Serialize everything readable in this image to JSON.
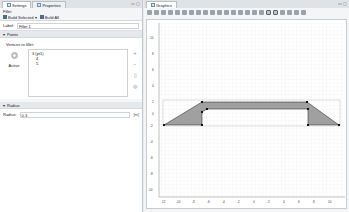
{
  "left_panel": {
    "tabs": [
      {
        "label": "Settings",
        "active": true
      },
      {
        "label": "Properties",
        "active": false
      }
    ],
    "title": "Fillet",
    "build_selected": "Build Selected",
    "build_all": "Build All",
    "label_caption": "Label:",
    "label_value": "Fillet 1",
    "points_section": "Points",
    "vertices_label": "Vertices to fillet:",
    "active_label": "Active",
    "vertices": [
      "3 (pt1)",
      "4",
      "5"
    ],
    "radius_section": "Radius",
    "radius_caption": "Radius:",
    "radius_value": "0.3",
    "radius_unit": "[m]"
  },
  "graphics": {
    "tab_label": "Graphics",
    "x_ticks": [
      "-12",
      "-10",
      "-8",
      "-6",
      "-4",
      "-2",
      "0",
      "2",
      "4",
      "6",
      "8",
      "10"
    ],
    "y_ticks": [
      "10",
      "8",
      "6",
      "4",
      "2",
      "0",
      "-2",
      "-4",
      "-6",
      "-8",
      "-10"
    ],
    "colors": {
      "fill": "#a0a0a0",
      "edge": "#1a1a1a",
      "grid": "#e3e5e8"
    }
  }
}
